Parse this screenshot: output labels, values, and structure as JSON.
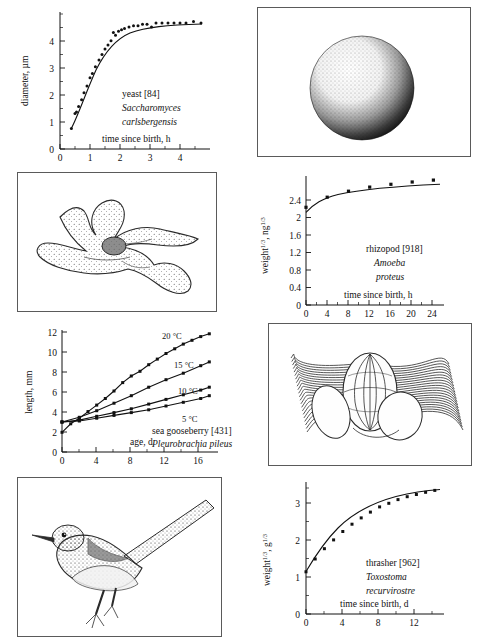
{
  "figure": {
    "layout": "two-column, four chart panels and four illustration panels"
  },
  "panels": {
    "yeast_illustration": {
      "name": "yeast cell stipple drawing",
      "subject": "Saccharomyces carlsbergensis cell"
    },
    "amoeba_illustration": {
      "name": "amoeba stipple drawing",
      "subject": "Amoeba proteus with pseudopodia"
    },
    "ctenophore_illustration": {
      "name": "sea gooseberry drawing",
      "subject": "Pleurobrachia pileus with comb rows and tentacles"
    },
    "thrasher_illustration": {
      "name": "thrasher bird drawing",
      "subject": "Toxostoma recurvirostre perched"
    }
  },
  "chart_data": [
    {
      "id": "yeast",
      "type": "scatter",
      "title": "",
      "caption_common": "yeast [84]",
      "caption_species_line1": "Saccharomyces",
      "caption_species_line2": "carlsbergensis",
      "xlabel": "time since birth, h",
      "ylabel": "diameter, µm",
      "xlim": [
        0,
        5
      ],
      "ylim": [
        0,
        5
      ],
      "xticks": [
        0,
        1,
        2,
        3,
        4
      ],
      "yticks": [
        0,
        1,
        2,
        3,
        4
      ],
      "xminor_step": 0.25,
      "yminor_step": 0.25,
      "grid": false,
      "legend": "none",
      "x": [
        0.38,
        0.5,
        0.55,
        0.62,
        0.72,
        0.8,
        0.9,
        1.0,
        1.08,
        1.18,
        1.3,
        1.4,
        1.5,
        1.6,
        1.7,
        1.78,
        1.85,
        1.95,
        2.05,
        2.15,
        2.3,
        2.45,
        2.6,
        2.75,
        2.9,
        3.05,
        3.2,
        3.4,
        3.6,
        3.8,
        4.0,
        4.2,
        4.45,
        4.7
      ],
      "y": [
        0.75,
        1.3,
        1.35,
        1.55,
        1.8,
        2.05,
        2.3,
        2.6,
        2.75,
        3.0,
        3.25,
        3.45,
        3.65,
        3.8,
        3.95,
        4.25,
        4.15,
        4.3,
        4.35,
        4.4,
        4.45,
        4.5,
        4.5,
        4.55,
        4.55,
        4.45,
        4.6,
        4.6,
        4.6,
        4.6,
        4.6,
        4.6,
        4.65,
        4.6
      ],
      "fit": "sigmoidal saturating curve approaching 4.6 µm"
    },
    {
      "id": "rhizopod",
      "type": "scatter",
      "caption_common": "rhizopod [918]",
      "caption_species_line1": "Amoeba",
      "caption_species_line2": "proteus",
      "xlabel": "time since birth, h",
      "ylabel": "weight¹ᐟ³ , ng¹ᐟ³",
      "ylabel_base": "weight",
      "ylabel_unit": "ng",
      "ylabel_exp": "1/3",
      "xlim": [
        0,
        26
      ],
      "ylim": [
        0,
        2.8
      ],
      "xticks": [
        0,
        4,
        8,
        12,
        16,
        20,
        24
      ],
      "yticks": [
        0,
        0.4,
        0.8,
        1.2,
        1.6,
        2.0,
        2.4
      ],
      "xminor_step": 1,
      "yminor_step": 0.1,
      "grid": false,
      "legend": "none",
      "x": [
        0,
        4,
        8,
        12,
        16,
        20,
        24
      ],
      "y": [
        2.12,
        2.34,
        2.47,
        2.56,
        2.62,
        2.67,
        2.71
      ],
      "fit": "saturating curve"
    },
    {
      "id": "sea_gooseberry",
      "type": "scatter",
      "caption_common": "sea gooseberry [431]",
      "caption_species_line1": "Pleurobrachia pileus",
      "xlabel": "age, d",
      "ylabel": "length, mm",
      "xlim": [
        0,
        18
      ],
      "ylim": [
        0,
        13
      ],
      "xticks": [
        0,
        4,
        8,
        12,
        16
      ],
      "yticks": [
        0,
        2,
        4,
        6,
        8,
        10,
        12
      ],
      "xminor_step": 1,
      "yminor_step": 0.5,
      "grid": false,
      "legend": "inline labels at curve ends",
      "series": [
        {
          "name": "20 °C",
          "x": [
            0,
            1,
            2,
            3,
            4,
            5,
            6,
            7,
            8,
            9,
            10,
            11,
            12,
            13,
            14,
            15,
            16,
            17
          ],
          "values": [
            2.1,
            3.0,
            3.6,
            4.3,
            5.0,
            5.7,
            6.5,
            7.4,
            8.1,
            8.6,
            9.3,
            9.9,
            10.5,
            11.0,
            11.5,
            11.9,
            12.3,
            12.6
          ]
        },
        {
          "name": "15 °C",
          "x": [
            0,
            2,
            4,
            6,
            8,
            10,
            12,
            14,
            16,
            17
          ],
          "values": [
            3.2,
            3.7,
            4.4,
            5.2,
            6.0,
            6.9,
            7.7,
            8.4,
            9.2,
            9.6
          ]
        },
        {
          "name": "10 °C",
          "x": [
            0,
            2,
            4,
            6,
            8,
            10,
            12,
            14,
            16,
            17
          ],
          "values": [
            3.2,
            3.4,
            3.8,
            4.2,
            4.6,
            5.1,
            5.6,
            6.1,
            6.6,
            6.9
          ]
        },
        {
          "name": "5 °C",
          "x": [
            0,
            2,
            4,
            6,
            8,
            10,
            12,
            14,
            16,
            17
          ],
          "values": [
            3.2,
            3.3,
            3.6,
            3.9,
            4.2,
            4.5,
            4.9,
            5.3,
            5.7,
            6.0
          ]
        }
      ]
    },
    {
      "id": "thrasher",
      "type": "scatter",
      "caption_common": "thrasher [962]",
      "caption_species_line1": "Toxostoma",
      "caption_species_line2": "recurvirostre",
      "xlabel": "time since birth, d",
      "ylabel": "weight¹ᐟ³ , g¹ᐟ³",
      "ylabel_base": "weight",
      "ylabel_unit": "g",
      "ylabel_exp": "1/3",
      "xlim": [
        0,
        15
      ],
      "ylim": [
        0,
        3.6
      ],
      "xticks": [
        0,
        4,
        8,
        12
      ],
      "yticks": [
        0,
        1,
        2,
        3
      ],
      "xminor_step": 1,
      "yminor_step": 0.25,
      "grid": false,
      "legend": "none",
      "x": [
        0,
        1,
        2,
        3,
        4,
        5,
        6,
        7,
        8,
        9,
        10,
        11,
        12,
        13,
        14
      ],
      "y": [
        1.15,
        1.5,
        1.78,
        2.02,
        2.25,
        2.45,
        2.62,
        2.78,
        2.92,
        3.02,
        3.12,
        3.2,
        3.26,
        3.32,
        3.37
      ],
      "fit": "von Bertalanffy saturating curve"
    }
  ]
}
